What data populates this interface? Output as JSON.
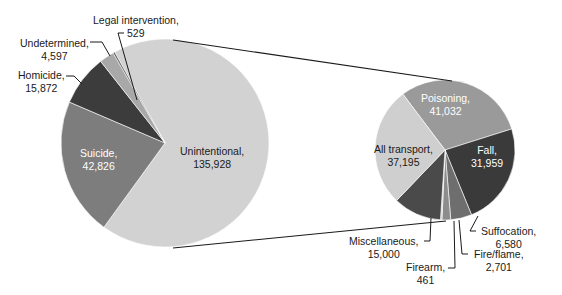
{
  "chart_data": [
    {
      "type": "pie",
      "title": "",
      "name": "All injury deaths by intent",
      "start_angle_deg": -119,
      "center": [
        165,
        143
      ],
      "radius": 104,
      "slices": [
        {
          "label": "Unintentional",
          "value": 135928,
          "display": "135,928",
          "color": "#d2d2d2"
        },
        {
          "label": "Suicide",
          "value": 42826,
          "display": "42,826",
          "color": "#7d7d7d"
        },
        {
          "label": "Homicide",
          "value": 15872,
          "display": "15,872",
          "color": "#3c3c3c"
        },
        {
          "label": "Undetermined",
          "value": 4597,
          "display": "4,597",
          "color": "#a8a8a8"
        },
        {
          "label": "Legal intervention",
          "value": 529,
          "display": "529",
          "color": "#5a5a5a"
        }
      ]
    },
    {
      "type": "pie",
      "title": "",
      "name": "Unintentional injury deaths by mechanism",
      "start_angle_deg": -127,
      "center": [
        445,
        150
      ],
      "radius": 70,
      "slices": [
        {
          "label": "Poisoning",
          "value": 41032,
          "display": "41,032",
          "color": "#9a9a9a"
        },
        {
          "label": "Fall",
          "value": 31959,
          "display": "31,959",
          "color": "#3a3a3a"
        },
        {
          "label": "Suffocation",
          "value": 6580,
          "display": "6,580",
          "color": "#6e6e6e"
        },
        {
          "label": "Fire/flame",
          "value": 2701,
          "display": "2,701",
          "color": "#8c8c8c"
        },
        {
          "label": "Firearm",
          "value": 461,
          "display": "461",
          "color": "#c4c4c4"
        },
        {
          "label": "Miscellaneous",
          "value": 15000,
          "display": "15,000",
          "color": "#4a4a4a"
        },
        {
          "label": "All transport",
          "value": 37195,
          "display": "37,195",
          "color": "#cfcfcf"
        }
      ]
    }
  ],
  "labels": {
    "unintentional": {
      "name": "Unintentional,",
      "value": "135,928"
    },
    "suicide": {
      "name": "Suicide,",
      "value": "42,826"
    },
    "homicide": {
      "name": "Homicide,",
      "value": "15,872"
    },
    "undetermined": {
      "name": "Undetermined,",
      "value": "4,597"
    },
    "legal": {
      "name": "Legal intervention,",
      "value": "529"
    },
    "poisoning": {
      "name": "Poisoning,",
      "value": "41,032"
    },
    "fall": {
      "name": "Fall,",
      "value": "31,959"
    },
    "transport": {
      "name": "All transport,",
      "value": "37,195"
    },
    "suffocation": {
      "name": "Suffocation,",
      "value": "6,580"
    },
    "fire": {
      "name": "Fire/flame,",
      "value": "2,701"
    },
    "firearm": {
      "name": "Firearm,",
      "value": "461"
    },
    "misc": {
      "name": "Miscellaneous,",
      "value": "15,000"
    }
  }
}
